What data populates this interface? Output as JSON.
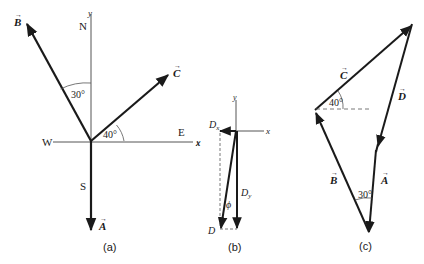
{
  "panels": {
    "a": {
      "caption": "(a)",
      "axis_y": "y",
      "axis_x": "x",
      "north": "N",
      "south": "S",
      "east": "E",
      "west": "W",
      "vector_A": "A",
      "vector_B": "B",
      "vector_C": "C",
      "angle_B": "30°",
      "angle_C": "40°"
    },
    "b": {
      "caption": "(b)",
      "axis_y": "y",
      "axis_x": "x",
      "Dx": "D",
      "Dx_sub": "x",
      "Dy": "D",
      "Dy_sub": "y",
      "D": "D",
      "phi": "ϕ"
    },
    "c": {
      "caption": "(c)",
      "vector_A": "A",
      "vector_B": "B",
      "vector_C": "C",
      "vector_D": "D",
      "angle_C": "40°",
      "angle_AB": "30°"
    }
  },
  "colors": {
    "stroke": "#1a1a1a",
    "axis": "#555555"
  }
}
